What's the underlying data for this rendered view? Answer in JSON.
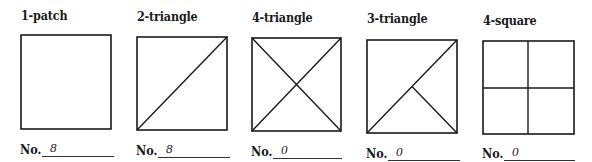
{
  "count_prefix": "No.",
  "blocks": [
    {
      "id": "1-patch",
      "title": "1-patch",
      "count": "8",
      "pattern": "square"
    },
    {
      "id": "2-triangle",
      "title": "2-triangle",
      "count": "8",
      "pattern": "single-diagonal"
    },
    {
      "id": "4-triangle",
      "title": "4-triangle",
      "count": "0",
      "pattern": "double-diagonal"
    },
    {
      "id": "3-triangle",
      "title": "3-triangle",
      "count": "0",
      "pattern": "diagonal-plus-half"
    },
    {
      "id": "4-square",
      "title": "4-square",
      "count": "0",
      "pattern": "four-quadrants"
    }
  ],
  "colors": {
    "ink": "#1a1a1a",
    "background": "#ffffff"
  }
}
